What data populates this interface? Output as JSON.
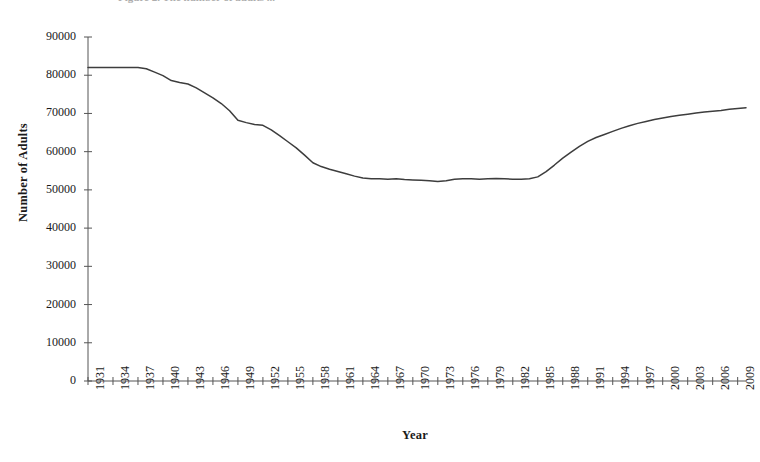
{
  "figure": {
    "caption_clipped": "Figure 2.  The number of adults ...",
    "y_axis_title": "Number of Adults",
    "x_axis_title": "Year"
  },
  "chart_data": {
    "type": "line",
    "title": "",
    "xlabel": "Year",
    "ylabel": "Number of Adults",
    "xlim": [
      1931,
      2010
    ],
    "ylim": [
      0,
      90000
    ],
    "grid": false,
    "legend": null,
    "line_color": "#3d3d3d",
    "y_ticks": [
      0,
      10000,
      20000,
      30000,
      40000,
      50000,
      60000,
      70000,
      80000,
      90000
    ],
    "y_tick_labels": [
      "0",
      "10000",
      "20000",
      "30000",
      "40000",
      "50000",
      "60000",
      "70000",
      "80000",
      "90000"
    ],
    "x_ticks": [
      1931,
      1934,
      1937,
      1940,
      1943,
      1946,
      1949,
      1952,
      1955,
      1958,
      1961,
      1964,
      1967,
      1970,
      1973,
      1976,
      1979,
      1982,
      1985,
      1988,
      1991,
      1994,
      1997,
      2000,
      2003,
      2006,
      2009
    ],
    "x_tick_labels": [
      "1931",
      "1934",
      "1937",
      "1940",
      "1943",
      "1946",
      "1949",
      "1952",
      "1955",
      "1958",
      "1961",
      "1964",
      "1967",
      "1970",
      "1973",
      "1976",
      "1979",
      "1982",
      "1985",
      "1988",
      "1991",
      "1994",
      "1997",
      "2000",
      "2003",
      "2006",
      "2009"
    ],
    "x": [
      1931,
      1932,
      1933,
      1934,
      1935,
      1936,
      1937,
      1938,
      1939,
      1940,
      1941,
      1942,
      1943,
      1944,
      1945,
      1946,
      1947,
      1948,
      1949,
      1950,
      1951,
      1952,
      1953,
      1954,
      1955,
      1956,
      1957,
      1958,
      1959,
      1960,
      1961,
      1962,
      1963,
      1964,
      1965,
      1966,
      1967,
      1968,
      1969,
      1970,
      1971,
      1972,
      1973,
      1974,
      1975,
      1976,
      1977,
      1978,
      1979,
      1980,
      1981,
      1982,
      1983,
      1984,
      1985,
      1986,
      1987,
      1988,
      1989,
      1990,
      1991,
      1992,
      1993,
      1994,
      1995,
      1996,
      1997,
      1998,
      1999,
      2000,
      2001,
      2002,
      2003,
      2004,
      2005,
      2006,
      2007,
      2008,
      2009,
      2010
    ],
    "values": [
      82000,
      82000,
      82000,
      82000,
      82000,
      82000,
      82000,
      81700,
      80800,
      79900,
      78600,
      78100,
      77700,
      76700,
      75400,
      74100,
      72600,
      70700,
      68200,
      67600,
      67100,
      66900,
      65700,
      64200,
      62600,
      61000,
      59100,
      57100,
      56100,
      55400,
      54800,
      54200,
      53600,
      53100,
      52900,
      52900,
      52800,
      52900,
      52700,
      52600,
      52500,
      52400,
      52200,
      52400,
      52800,
      52900,
      52900,
      52800,
      52900,
      53000,
      52900,
      52800,
      52800,
      52900,
      53400,
      54800,
      56500,
      58300,
      59900,
      61400,
      62700,
      63700,
      64500,
      65300,
      66100,
      66800,
      67400,
      67900,
      68400,
      68800,
      69200,
      69500,
      69800,
      70100,
      70400,
      70600,
      70800,
      71100,
      71300,
      71500
    ],
    "series_name": "Number of Adults",
    "notes": {
      "plateau_start": 82000,
      "plateau_years": "1931-1937",
      "minimum_value": 52200,
      "minimum_year": 1973,
      "final_value": 71500,
      "final_year": 2010
    }
  }
}
